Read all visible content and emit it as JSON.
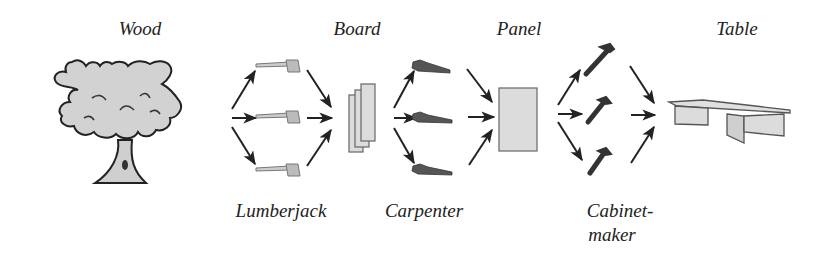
{
  "diagram": {
    "type": "process-flow",
    "stages": [
      {
        "id": "wood",
        "label": "Wood",
        "icon": "tree-icon"
      },
      {
        "id": "board",
        "label": "Board",
        "icon": "boards-icon"
      },
      {
        "id": "panel",
        "label": "Panel",
        "icon": "panel-icon"
      },
      {
        "id": "table",
        "label": "Table",
        "icon": "table-icon"
      }
    ],
    "workers": [
      {
        "id": "lumberjack",
        "label": "Lumberjack",
        "tool": "axe-icon",
        "count": 3
      },
      {
        "id": "carpenter",
        "label": "Carpenter",
        "tool": "saw-icon",
        "count": 3
      },
      {
        "id": "cabinetmaker",
        "label_line1": "Cabinet-",
        "label_line2": "maker",
        "tool": "hammer-icon",
        "count": 3
      }
    ],
    "colors": {
      "fill": "#d9d9d9",
      "stroke": "#333333",
      "tool_dark": "#444444",
      "background": "#ffffff"
    }
  }
}
